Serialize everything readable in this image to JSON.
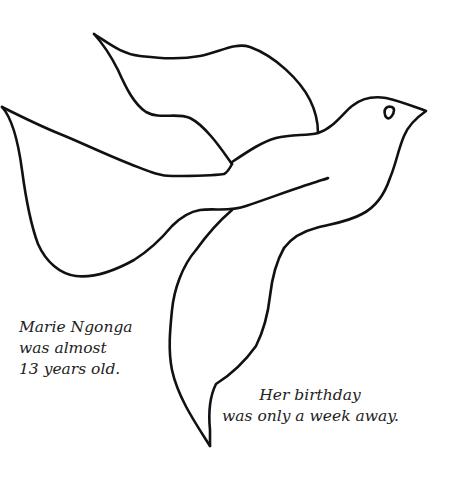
{
  "illustration": {
    "subject": "dove-outline",
    "stroke_color": "#111111",
    "background_color": "#ffffff"
  },
  "captions": {
    "left": {
      "lines": [
        "Marie Ngonga",
        "was almost",
        "13 years old."
      ]
    },
    "right": {
      "lines": [
        "Her birthday",
        "was only a week away."
      ]
    }
  }
}
